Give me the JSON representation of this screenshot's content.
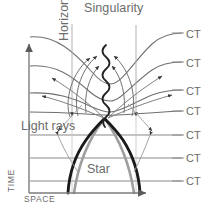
{
  "figure": {
    "title_label": "Singularity",
    "horizon_label": "Horizon",
    "light_rays_label": "Light rays",
    "star_label": "Star",
    "axis_y_label": "TIME",
    "axis_x_label": "SPACE",
    "caption": "",
    "colors": {
      "line": "#6f6f6f",
      "star_worldline": "#1a1a1a",
      "horizon_arc": "#9a9a9a",
      "text": "#6b6b6b",
      "axis": "#8d8d8d",
      "background": "#ffffff"
    }
  },
  "ct_labels": [
    {
      "text": "CT",
      "y": 35
    },
    {
      "text": "CT",
      "y": 64
    },
    {
      "text": "CT",
      "y": 92
    },
    {
      "text": "CT",
      "y": 112
    },
    {
      "text": "CT",
      "y": 136
    },
    {
      "text": "CT",
      "y": 159
    },
    {
      "text": "CT",
      "y": 182
    }
  ],
  "chart_data": {
    "type": "line",
    "title": "Singularity",
    "xlabel": "SPACE",
    "ylabel": "TIME",
    "grid": false,
    "legend": "none",
    "annotations": [
      "Singularity",
      "Horizon",
      "Light rays",
      "Star",
      "CT",
      "CT",
      "CT",
      "CT",
      "CT",
      "CT",
      "CT"
    ],
    "series": [
      {
        "name": "constant-time slice 1",
        "kind": "curved",
        "y_right": 35
      },
      {
        "name": "constant-time slice 2",
        "kind": "curved",
        "y_right": 64
      },
      {
        "name": "constant-time slice 3",
        "kind": "curved",
        "y_right": 92
      },
      {
        "name": "constant-time slice 4",
        "kind": "curved",
        "y_right": 112
      },
      {
        "name": "constant-time slice 5",
        "kind": "straight",
        "y_right": 136
      },
      {
        "name": "constant-time slice 6",
        "kind": "straight",
        "y_right": 159
      },
      {
        "name": "constant-time slice 7",
        "kind": "straight",
        "y_right": 182
      },
      {
        "name": "star surface worldline left",
        "kind": "thick-dark"
      },
      {
        "name": "star surface worldline right",
        "kind": "thick-dark"
      },
      {
        "name": "event horizon arc",
        "kind": "gray-arch"
      },
      {
        "name": "singularity",
        "kind": "wavy-vertical"
      }
    ]
  }
}
